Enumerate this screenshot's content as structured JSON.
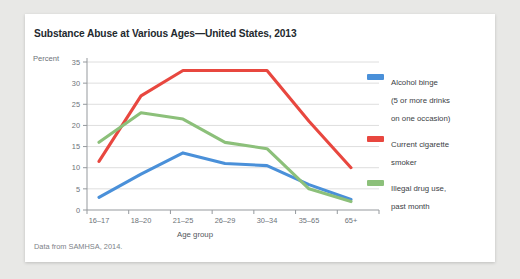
{
  "figure": {
    "title": "Substance Abuse at Various Ages—United States, 2013",
    "source_note": "Data from SAMHSA, 2014.",
    "percent_label": "Percent"
  },
  "chart_data": {
    "type": "line",
    "title": "Substance Abuse at Various Ages—United States, 2013",
    "xlabel": "Age group",
    "ylabel": "Percent",
    "ylim": [
      0,
      35
    ],
    "ytick_step": 5,
    "yticks": [
      "0",
      "5",
      "10",
      "15",
      "20",
      "25",
      "30",
      "35"
    ],
    "grid": "horizontal",
    "legend_position": "right",
    "categories": [
      "16–17",
      "18–20",
      "21–25",
      "26–29",
      "30–34",
      "35–65",
      "65+"
    ],
    "series": [
      {
        "name": "Alcohol binge\n(5 or more drinks\non one occasion)",
        "short_name": "Alcohol binge",
        "color": "#4a90d9",
        "values": [
          3,
          8.5,
          13.5,
          11,
          10.5,
          6,
          2.5
        ]
      },
      {
        "name": "Current cigarette\nsmoker",
        "short_name": "Current cigarette smoker",
        "color": "#e8473f",
        "values": [
          11.5,
          27,
          33,
          33,
          33,
          21,
          10
        ]
      },
      {
        "name": "Illegal drug use,\npast month",
        "short_name": "Illegal drug use, past month",
        "color": "#8cc07a",
        "values": [
          16,
          23,
          21.5,
          16,
          14.5,
          5,
          2
        ]
      }
    ]
  }
}
